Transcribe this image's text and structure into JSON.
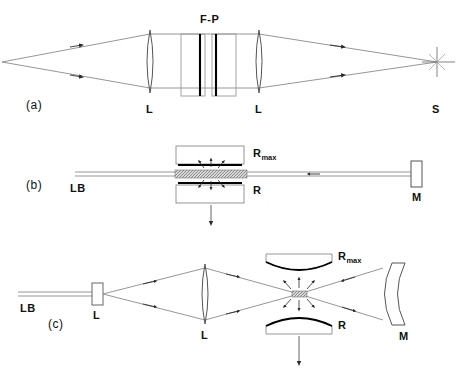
{
  "figure": {
    "panels": [
      {
        "id": "a",
        "panel_label": "(a)",
        "description": "Diverging source imaged through two lenses and a Fabry-Perot etalon to a point",
        "labels": {
          "etalon": "F-P",
          "lens_left": "L",
          "lens_right": "L",
          "screen_point": "S"
        }
      },
      {
        "id": "b",
        "panel_label": "(b)",
        "description": "Laser beam passing through plane-parallel mirror cavity with gain region, terminated by mirror",
        "labels": {
          "laser_beam": "LB",
          "mirror_top": "R",
          "mirror_top_sub": "max",
          "mirror_bottom": "R",
          "end_mirror": "M"
        }
      },
      {
        "id": "c",
        "panel_label": "(c)",
        "description": "Laser beam expanded by lens pair into curved mirror cavity focus and end mirror",
        "labels": {
          "laser_beam": "LB",
          "lens_input": "L",
          "lens_main": "L",
          "mirror_top": "R",
          "mirror_top_sub": "max",
          "mirror_bottom": "R",
          "end_mirror": "M"
        }
      }
    ],
    "colors": {
      "ray": "#6d6d6d",
      "outline": "#7a7a7a",
      "coating": "#000000",
      "text": "#111111",
      "background": "#ffffff"
    }
  }
}
